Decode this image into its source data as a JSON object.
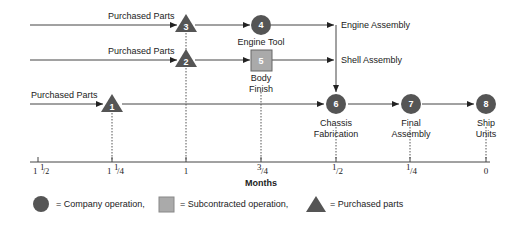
{
  "colors": {
    "company_op": "#555555",
    "subcontracted_op": "#aaaaaa",
    "purchased": "#555555",
    "line": "#444444",
    "text": "#222222"
  },
  "inputs": [
    {
      "label": "Purchased Parts",
      "row": "top"
    },
    {
      "label": "Purchased Parts",
      "row": "middle"
    },
    {
      "label": "Purchased Parts",
      "row": "bottom"
    }
  ],
  "nodes": [
    {
      "id": "1",
      "shape": "triangle",
      "type": "Purchased parts",
      "label": ""
    },
    {
      "id": "2",
      "shape": "triangle",
      "type": "Purchased parts",
      "label": ""
    },
    {
      "id": "3",
      "shape": "triangle",
      "type": "Purchased parts",
      "label": ""
    },
    {
      "id": "4",
      "shape": "circle",
      "type": "Company operation",
      "label": "Engine Tool"
    },
    {
      "id": "5",
      "shape": "square",
      "type": "Subcontracted operation",
      "label_line1": "Body",
      "label_line2": "Finish"
    },
    {
      "id": "6",
      "shape": "circle",
      "type": "Company operation",
      "label_line1": "Chassis",
      "label_line2": "Fabrication"
    },
    {
      "id": "7",
      "shape": "circle",
      "type": "Company operation",
      "label_line1": "Final",
      "label_line2": "Assembly"
    },
    {
      "id": "8",
      "shape": "circle",
      "type": "Company operation",
      "label_line1": "Ship",
      "label_line2": "Units"
    }
  ],
  "branch_labels": {
    "engine": "Engine Assembly",
    "shell": "Shell Assembly"
  },
  "axis": {
    "title": "Months",
    "ticks": [
      {
        "whole": "1",
        "frac_num": "1",
        "frac_den": "2"
      },
      {
        "whole": "1",
        "frac_num": "1",
        "frac_den": "4"
      },
      {
        "whole": "1",
        "frac_num": "",
        "frac_den": ""
      },
      {
        "whole": "",
        "frac_num": "3",
        "frac_den": "4"
      },
      {
        "whole": "",
        "frac_num": "1",
        "frac_den": "2"
      },
      {
        "whole": "",
        "frac_num": "1",
        "frac_den": "4"
      },
      {
        "whole": "0",
        "frac_num": "",
        "frac_den": ""
      }
    ]
  },
  "legend": {
    "circle": "= Company operation,",
    "square": "= Subcontracted operation,",
    "triangle": "= Purchased parts"
  }
}
